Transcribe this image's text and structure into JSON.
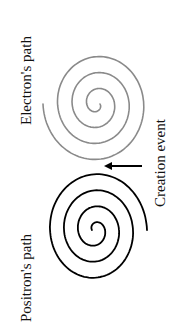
{
  "labels": {
    "electron": "Electron's path",
    "positron": "Positron's path",
    "creation": "Creation event"
  },
  "colors": {
    "electron_path": "#8a8a8a",
    "positron_path": "#000000",
    "arrow": "#000000",
    "text": "#111111",
    "background": "#ffffff"
  },
  "paths": {
    "electron": {
      "turns": 3.5,
      "shade": "gray"
    },
    "positron": {
      "turns": 3.5,
      "shade": "black"
    }
  },
  "icons": {
    "arrow": "left-arrow"
  }
}
